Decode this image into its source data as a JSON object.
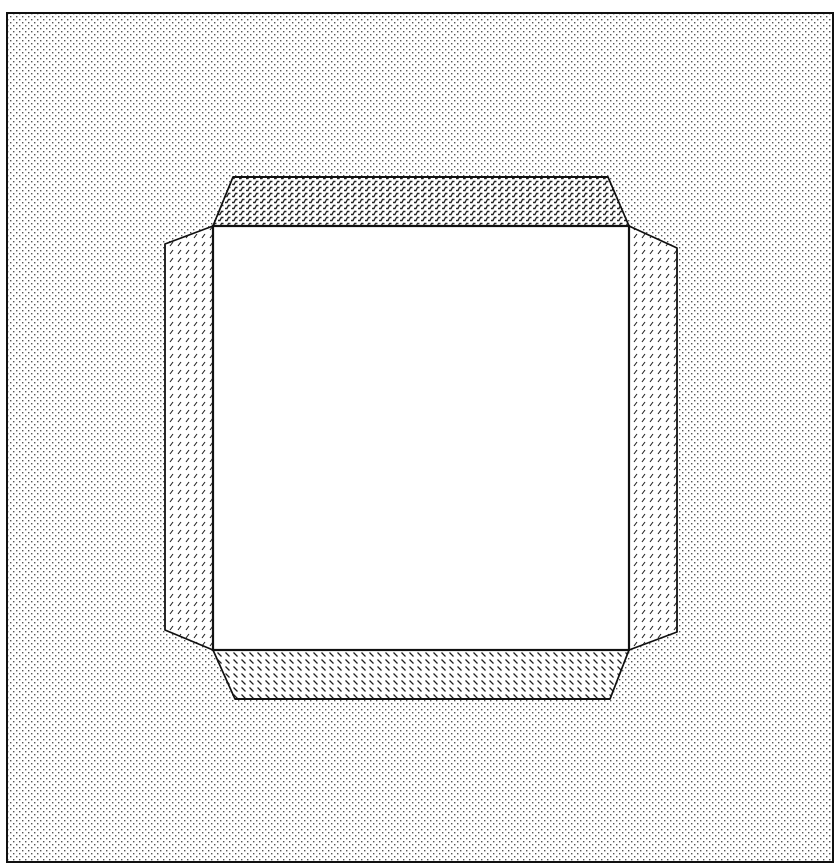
{
  "canvas": {
    "width": 837,
    "height": 867,
    "background": "#ffffff"
  },
  "colors": {
    "ink": "#111111",
    "dot": "#555555",
    "hatch": "#222222",
    "paper": "#ffffff"
  },
  "frame": {
    "x": 7,
    "y": 13,
    "width": 826,
    "height": 849,
    "fill": "dot-stipple"
  },
  "center_square": {
    "x": 213,
    "y": 226,
    "width": 416,
    "height": 424,
    "fill": "white"
  },
  "flaps": [
    {
      "name": "top-flap",
      "fill": "hatch-dense-forward",
      "points": [
        [
          213,
          226
        ],
        [
          629,
          226
        ],
        [
          608,
          177
        ],
        [
          233,
          177
        ]
      ]
    },
    {
      "name": "bottom-flap",
      "fill": "hatch-back",
      "points": [
        [
          213,
          650
        ],
        [
          629,
          650
        ],
        [
          610,
          699
        ],
        [
          235,
          699
        ]
      ]
    },
    {
      "name": "left-flap",
      "fill": "hatch-sparse-forward",
      "points": [
        [
          213,
          226
        ],
        [
          213,
          650
        ],
        [
          165,
          630
        ],
        [
          165,
          244
        ]
      ]
    },
    {
      "name": "right-flap",
      "fill": "hatch-sparse-forward",
      "points": [
        [
          629,
          226
        ],
        [
          629,
          650
        ],
        [
          677,
          632
        ],
        [
          677,
          248
        ]
      ]
    }
  ]
}
